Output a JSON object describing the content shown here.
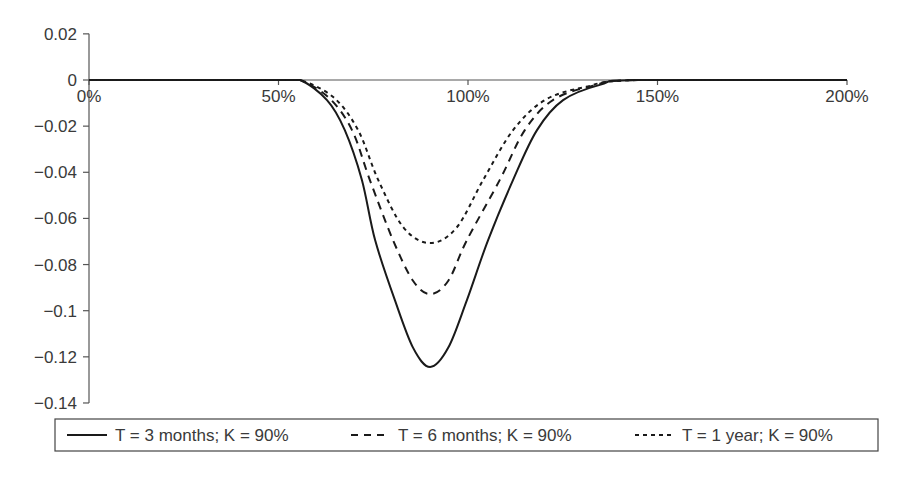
{
  "chart_data": {
    "type": "line",
    "title": "",
    "xlabel": "",
    "ylabel": "",
    "xlim": [
      0,
      200
    ],
    "ylim": [
      -0.14,
      0.02
    ],
    "x_ticks": [
      "0%",
      "50%",
      "100%",
      "150%",
      "200%"
    ],
    "x_tick_values": [
      0,
      50,
      100,
      150,
      200
    ],
    "y_ticks": [
      "0.02",
      "0",
      "−0.02",
      "−0.04",
      "−0.06",
      "−0.08",
      "−0.1",
      "−0.12",
      "−0.14"
    ],
    "y_tick_values": [
      0.02,
      0,
      -0.02,
      -0.04,
      -0.06,
      -0.08,
      -0.1,
      -0.12,
      -0.14
    ],
    "grid": false,
    "legend_position": "bottom",
    "series": [
      {
        "name": "T = 3 months; K = 90%",
        "style": "solid",
        "x": [
          0,
          50,
          55.7,
          62.8,
          67.5,
          72.0,
          75.5,
          80.7,
          85.5,
          90,
          94.8,
          99.7,
          105.3,
          111.9,
          118.2,
          125.1,
          135,
          145,
          200
        ],
        "y": [
          0,
          0,
          0,
          -0.0087,
          -0.0217,
          -0.0433,
          -0.0694,
          -0.0954,
          -0.116,
          -0.1244,
          -0.116,
          -0.0954,
          -0.0694,
          -0.0433,
          -0.0217,
          -0.0087,
          -0.002,
          0,
          0
        ]
      },
      {
        "name": "T = 6 months; K = 90%",
        "style": "dashed",
        "x": [
          0,
          50,
          55.7,
          63.5,
          69.4,
          74.1,
          80.2,
          85.5,
          90,
          94.8,
          99.7,
          108.4,
          115,
          122.4,
          133,
          145,
          200
        ],
        "y": [
          0,
          0,
          0,
          -0.008,
          -0.0217,
          -0.0433,
          -0.0694,
          -0.087,
          -0.0928,
          -0.087,
          -0.0694,
          -0.0433,
          -0.0217,
          -0.0087,
          -0.0025,
          0,
          0
        ]
      },
      {
        "name": "T = 1 year; K = 90%",
        "style": "short-dashed",
        "x": [
          0,
          50,
          55.7,
          64.5,
          71.0,
          76.3,
          83.0,
          90,
          97.0,
          104.0,
          111.9,
          120.3,
          131,
          145,
          200
        ],
        "y": [
          0,
          0,
          0,
          -0.0075,
          -0.0217,
          -0.0433,
          -0.064,
          -0.0707,
          -0.064,
          -0.0433,
          -0.0217,
          -0.0087,
          -0.003,
          0,
          0
        ]
      }
    ]
  },
  "legend": {
    "items": [
      {
        "label": "T = 3 months; K = 90%"
      },
      {
        "label": "T = 6 months; K = 90%"
      },
      {
        "label": "T = 1 year; K = 90%"
      }
    ]
  },
  "colors": {
    "line": "#1a1a1a",
    "axis": "#555555",
    "text": "#3a3a3a"
  }
}
